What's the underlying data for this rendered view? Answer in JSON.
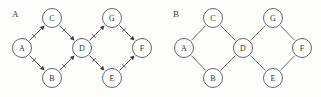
{
  "figure": {
    "width": 321,
    "height": 97,
    "background_color": "#fdfdfc",
    "stroke_color": "#5a5a5a",
    "node_fill_color": "#ffffff",
    "label_color": "#2e2e2e",
    "arrow_color": "#3d3d3d"
  },
  "panels": [
    {
      "id": "panel-a",
      "label": "A",
      "label_x": 12,
      "label_y": 17,
      "graph_type": "directed",
      "node_radius": 9.5,
      "nodes": [
        {
          "id": "A",
          "label": "A",
          "x": 22,
          "y": 48
        },
        {
          "id": "C",
          "label": "C",
          "x": 52,
          "y": 18
        },
        {
          "id": "B",
          "label": "B",
          "x": 52,
          "y": 78
        },
        {
          "id": "D",
          "label": "D",
          "x": 82,
          "y": 48
        },
        {
          "id": "G",
          "label": "G",
          "x": 112,
          "y": 18
        },
        {
          "id": "E",
          "label": "E",
          "x": 112,
          "y": 78
        },
        {
          "id": "F",
          "label": "F",
          "x": 142,
          "y": 48
        }
      ],
      "edges": [
        {
          "from": "A",
          "to": "C",
          "directed": true
        },
        {
          "from": "A",
          "to": "B",
          "directed": true
        },
        {
          "from": "C",
          "to": "D",
          "directed": true
        },
        {
          "from": "B",
          "to": "D",
          "directed": true
        },
        {
          "from": "D",
          "to": "G",
          "directed": true
        },
        {
          "from": "D",
          "to": "E",
          "directed": true
        },
        {
          "from": "G",
          "to": "F",
          "directed": true
        },
        {
          "from": "E",
          "to": "F",
          "directed": true
        }
      ]
    },
    {
      "id": "panel-b",
      "label": "B",
      "label_x": 173,
      "label_y": 17,
      "graph_type": "undirected",
      "node_radius": 9.5,
      "nodes": [
        {
          "id": "A",
          "label": "A",
          "x": 184,
          "y": 48
        },
        {
          "id": "C",
          "label": "C",
          "x": 213,
          "y": 18
        },
        {
          "id": "B",
          "label": "B",
          "x": 213,
          "y": 78
        },
        {
          "id": "D",
          "label": "D",
          "x": 243,
          "y": 48
        },
        {
          "id": "G",
          "label": "G",
          "x": 273,
          "y": 18
        },
        {
          "id": "E",
          "label": "E",
          "x": 273,
          "y": 78
        },
        {
          "id": "F",
          "label": "F",
          "x": 302,
          "y": 48
        }
      ],
      "edges": [
        {
          "from": "A",
          "to": "C",
          "directed": false
        },
        {
          "from": "A",
          "to": "B",
          "directed": false
        },
        {
          "from": "C",
          "to": "D",
          "directed": false
        },
        {
          "from": "B",
          "to": "D",
          "directed": false
        },
        {
          "from": "D",
          "to": "G",
          "directed": false
        },
        {
          "from": "D",
          "to": "E",
          "directed": false
        },
        {
          "from": "G",
          "to": "F",
          "directed": false
        },
        {
          "from": "E",
          "to": "F",
          "directed": false
        }
      ]
    }
  ]
}
